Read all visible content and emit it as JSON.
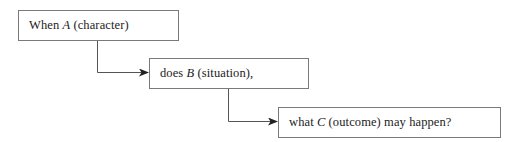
{
  "diagram": {
    "steps": [
      {
        "prefix": "When ",
        "variable": "A",
        "suffix": " (character)"
      },
      {
        "prefix": "does ",
        "variable": "B",
        "suffix": " (situation),"
      },
      {
        "prefix": "what ",
        "variable": "C",
        "suffix": " (outcome) may happen?"
      }
    ],
    "colors": {
      "box_border": "#7a7a7a",
      "connector": "#555555",
      "arrowhead": "#222222",
      "text": "#222222"
    }
  }
}
